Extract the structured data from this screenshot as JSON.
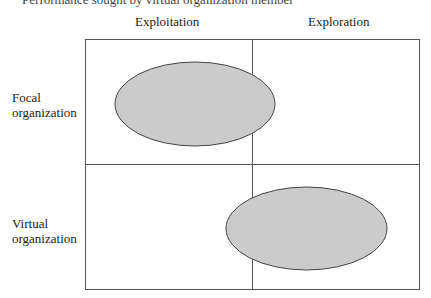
{
  "caption": "Performance sought by virtual organization member",
  "columns": [
    {
      "label": "Exploitation"
    },
    {
      "label": "Exploration"
    }
  ],
  "rows": [
    {
      "label_line1": "Focal",
      "label_line2": "organization"
    },
    {
      "label_line1": "Virtual",
      "label_line2": "organization"
    }
  ],
  "colors": {
    "ellipse_fill": "#cbcbcb",
    "stroke": "#444444"
  }
}
